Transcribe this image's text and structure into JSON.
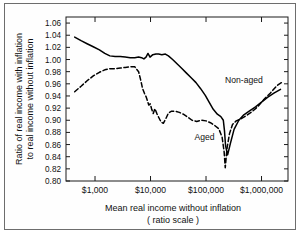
{
  "figure": {
    "background": "#ffffff",
    "frame_color": "#6d6d6d",
    "ink_color": "#000000"
  },
  "chart_data": {
    "type": "line",
    "title": "",
    "xlabel": "Mean real income without inflation",
    "xlabel_sub": "( ratio scale )",
    "ylabel_line1": "Ratio of real income with inflation",
    "ylabel_line2": "to real income without inflation",
    "xscale": "log",
    "xlim": [
      300,
      3000000
    ],
    "ylim": [
      0.8,
      1.07
    ],
    "grid": false,
    "legend_position": "inline-annotation",
    "xticks": [
      1000,
      10000,
      100000,
      1000000
    ],
    "xticklabels": [
      "$1,000",
      "$10,000",
      "$100,000",
      "$1,000,000"
    ],
    "yticks": [
      0.8,
      0.82,
      0.84,
      0.86,
      0.88,
      0.9,
      0.92,
      0.94,
      0.96,
      0.98,
      1.0,
      1.02,
      1.04,
      1.06
    ],
    "yticklabels": [
      "0.80",
      "0.82",
      "0.84",
      "0.86",
      "0.88",
      "0.90",
      "0.92",
      "0.94",
      "0.96",
      "0.98",
      "1.00",
      "1.02",
      "1.04",
      "1.06"
    ],
    "series": [
      {
        "name": "Non-aged",
        "style": "solid",
        "label_x": 220000,
        "label_y": 0.962,
        "x": [
          430,
          560,
          720,
          930,
          1200,
          1500,
          1850,
          2300,
          2850,
          3500,
          4300,
          5200,
          6100,
          6900,
          7600,
          8300,
          9000,
          9800,
          11000,
          12500,
          14000,
          16000,
          18500,
          21000,
          25000,
          30000,
          36000,
          44000,
          54000,
          66000,
          80000,
          97000,
          115000,
          135000,
          160000,
          185000,
          205000,
          215000,
          225000,
          245000,
          275000,
          320000,
          390000,
          480000,
          600000,
          780000,
          1000000,
          1300000,
          1700000,
          2200000
        ],
        "y": [
          1.037,
          1.031,
          1.026,
          1.021,
          1.016,
          1.01,
          1.006,
          1.005,
          1.005,
          1.004,
          1.003,
          1.003,
          1.004,
          1.003,
          1.001,
          1.004,
          1.01,
          1.004,
          1.008,
          1.009,
          1.009,
          1.008,
          1.009,
          1.006,
          1.0,
          0.993,
          0.986,
          0.978,
          0.97,
          0.962,
          0.952,
          0.941,
          0.929,
          0.918,
          0.91,
          0.906,
          0.9,
          0.883,
          0.858,
          0.843,
          0.862,
          0.885,
          0.9,
          0.909,
          0.915,
          0.922,
          0.93,
          0.938,
          0.945,
          0.951
        ]
      },
      {
        "name": "Aged",
        "style": "dashed",
        "label_x": 62000,
        "label_y": 0.868,
        "x": [
          430,
          560,
          720,
          930,
          1200,
          1500,
          1850,
          2300,
          2850,
          3500,
          4300,
          5200,
          6100,
          6700,
          7200,
          7800,
          8300,
          8800,
          9300,
          9900,
          10500,
          11200,
          12000,
          13000,
          14000,
          15500,
          17000,
          19000,
          21000,
          24000,
          28000,
          33000,
          39000,
          47000,
          56000,
          68000,
          82000,
          100000,
          120000,
          145000,
          170000,
          195000,
          212000,
          222000,
          240000,
          265000,
          300000,
          350000,
          420000,
          520000,
          650000,
          850000,
          1100000,
          1450000,
          1900000,
          2300000
        ],
        "y": [
          0.947,
          0.956,
          0.965,
          0.973,
          0.979,
          0.983,
          0.985,
          0.985,
          0.986,
          0.987,
          0.988,
          0.988,
          0.98,
          0.965,
          0.952,
          0.944,
          0.939,
          0.932,
          0.925,
          0.927,
          0.918,
          0.911,
          0.919,
          0.911,
          0.905,
          0.897,
          0.895,
          0.903,
          0.912,
          0.915,
          0.915,
          0.913,
          0.91,
          0.905,
          0.9,
          0.898,
          0.9,
          0.899,
          0.896,
          0.891,
          0.886,
          0.872,
          0.848,
          0.822,
          0.855,
          0.878,
          0.893,
          0.899,
          0.902,
          0.907,
          0.913,
          0.922,
          0.934,
          0.945,
          0.957,
          0.962
        ]
      }
    ]
  }
}
